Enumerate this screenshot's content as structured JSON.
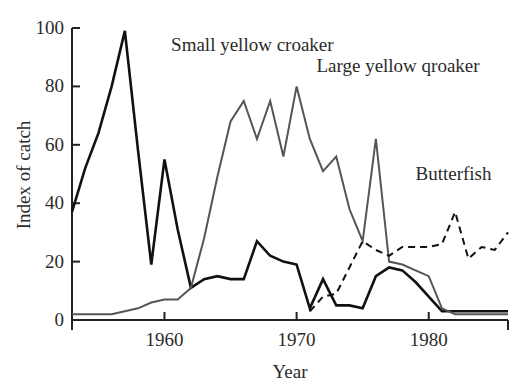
{
  "chart_data": {
    "type": "line",
    "title": "",
    "xlabel": "Year",
    "ylabel": "Index of catch",
    "xlim": [
      1953,
      1986
    ],
    "ylim": [
      0,
      100
    ],
    "xticks": [
      1960,
      1970,
      1980
    ],
    "xtick_labels": [
      "1960",
      "1970",
      "1980"
    ],
    "yticks": [
      0,
      20,
      40,
      60,
      80,
      100
    ],
    "ytick_labels": [
      "0",
      "20",
      "40",
      "60",
      "80",
      "100"
    ],
    "grid": false,
    "legend_position": "inline-annotations",
    "series": [
      {
        "name": "Small yellow croaker",
        "style": "solid",
        "color": "#111111",
        "width": 2.6,
        "label_x": 1960.5,
        "label_y": 92,
        "x": [
          1953,
          1954,
          1955,
          1956,
          1957,
          1958,
          1959,
          1960,
          1961,
          1962,
          1963,
          1964,
          1965,
          1966,
          1967,
          1968,
          1969,
          1970,
          1971,
          1972,
          1973,
          1974,
          1975,
          1976,
          1977,
          1978,
          1979,
          1980,
          1981,
          1982,
          1983,
          1984,
          1985,
          1986
        ],
        "y": [
          37,
          52,
          64,
          80,
          99,
          58,
          19,
          55,
          31,
          11,
          14,
          15,
          14,
          14,
          27,
          22,
          20,
          19,
          4,
          14,
          5,
          5,
          4,
          15,
          18,
          17,
          13,
          8,
          3,
          3,
          3,
          3,
          3,
          3
        ]
      },
      {
        "name": "Large yellow qroaker",
        "style": "solid",
        "color": "#555555",
        "width": 2.0,
        "label_x": 1971.5,
        "label_y": 85,
        "x": [
          1953,
          1954,
          1955,
          1956,
          1957,
          1958,
          1959,
          1960,
          1961,
          1962,
          1963,
          1964,
          1965,
          1966,
          1967,
          1968,
          1969,
          1970,
          1971,
          1972,
          1973,
          1974,
          1975,
          1976,
          1977,
          1978,
          1979,
          1980,
          1981,
          1982,
          1983,
          1984,
          1985,
          1986
        ],
        "y": [
          2,
          2,
          2,
          2,
          3,
          4,
          6,
          7,
          7,
          11,
          28,
          49,
          68,
          75,
          62,
          75,
          56,
          80,
          62,
          51,
          56,
          38,
          27,
          62,
          20,
          19,
          17,
          15,
          4,
          2,
          2,
          2,
          2,
          2
        ]
      },
      {
        "name": "Butterfish",
        "style": "dashed",
        "color": "#111111",
        "width": 2.0,
        "label_x": 1979,
        "label_y": 48,
        "x": [
          1971,
          1972,
          1973,
          1974,
          1975,
          1976,
          1977,
          1978,
          1979,
          1980,
          1981,
          1982,
          1983,
          1984,
          1985,
          1986
        ],
        "y": [
          3,
          8,
          9,
          18,
          27,
          24,
          22,
          25,
          25,
          25,
          26,
          37,
          21,
          25,
          24,
          30
        ]
      }
    ]
  },
  "axes": {
    "y_title": "Index of catch",
    "x_title": "Year"
  },
  "labels": {
    "small_yellow_croaker": "Small yellow croaker",
    "large_yellow_croaker": "Large yellow qroaker",
    "butterfish": "Butterfish"
  }
}
